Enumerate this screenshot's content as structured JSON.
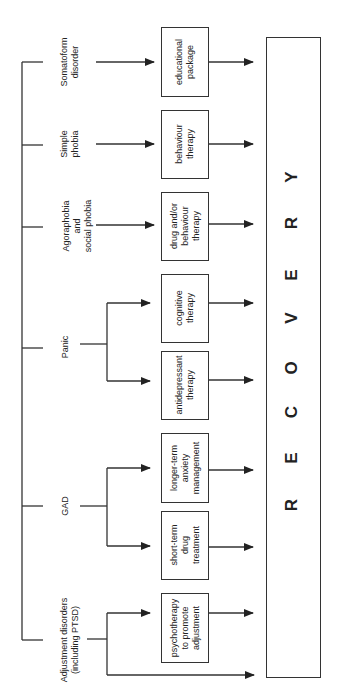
{
  "diagram": {
    "type": "treatment-pathway-flowchart",
    "orientation": "rotated-90",
    "outcome": {
      "label": "RECOVERY",
      "letters": [
        "R",
        "E",
        "C",
        "O",
        "V",
        "E",
        "R",
        "Y"
      ]
    },
    "disorders": [
      {
        "id": "somatoform",
        "label": "Somatoform\ndisorder",
        "treatments": [
          "educational package"
        ]
      },
      {
        "id": "simple-phobia",
        "label": "Simple\nphobia",
        "treatments": [
          "behaviour therapy"
        ]
      },
      {
        "id": "agoraphobia",
        "label": "Agoraphobia\nand\nsocial phobia",
        "treatments": [
          "drug and/or behaviour therapy"
        ]
      },
      {
        "id": "panic",
        "label": "Panic",
        "treatments": [
          "cognitive therapy",
          "antidepressant therapy"
        ]
      },
      {
        "id": "gad",
        "label": "GAD",
        "treatments": [
          "longer-term anxiety management",
          "short-term drug treatment"
        ]
      },
      {
        "id": "adjustment",
        "label": "Adjustment disorders\n(including PTSD)",
        "treatments": [
          "psychotherapy to promote adjustment",
          "(direct to recovery)"
        ]
      }
    ],
    "boxes": {
      "educational": "educational\npackage",
      "behaviour": "behaviour\ntherapy",
      "drug_behaviour": "drug and/or\nbehaviour\ntherapy",
      "cognitive": "cognitive\ntherapy",
      "antidepressant": "antidepressant\ntherapy",
      "longer_term": "longer-term\nanxiety\nmanagement",
      "short_term": "short-term\ndrug\ntreatment",
      "psychotherapy": "psychotherapy\nto promote\nadjustment"
    },
    "labels": {
      "somatoform": "Somatoform\ndisorder",
      "simple_phobia": "Simple\nphobia",
      "agoraphobia": "Agoraphobia\nand\nsocial phobia",
      "panic": "Panic",
      "gad": "GAD",
      "adjustment": "Adjustment disorders\n(including PTSD)"
    },
    "colors": {
      "line": "#333333",
      "text": "#222222",
      "background": "#ffffff"
    }
  }
}
